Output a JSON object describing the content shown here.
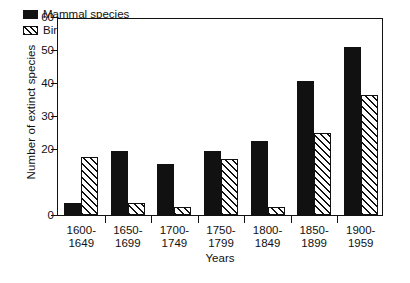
{
  "chart_data": {
    "type": "bar",
    "title": "",
    "xlabel": "Years",
    "ylabel": "Number of extinct species",
    "categories": [
      "1600-\n1649",
      "1650-\n1699",
      "1700-\n1749",
      "1750-\n1799",
      "1800-\n1849",
      "1850-\n1899",
      "1900-\n1959"
    ],
    "category_lines": [
      [
        "1600-",
        "1649"
      ],
      [
        "1650-",
        "1699"
      ],
      [
        "1700-",
        "1749"
      ],
      [
        "1750-",
        "1799"
      ],
      [
        "1800-",
        "1849"
      ],
      [
        "1850-",
        "1899"
      ],
      [
        "1900-",
        "1959"
      ]
    ],
    "series": [
      {
        "name": "Mammal species",
        "fill": "solid-black",
        "values": [
          3.5,
          19.5,
          15.5,
          19.5,
          22.5,
          40.5,
          51
        ]
      },
      {
        "name": "Birds",
        "fill": "diagonal-hatch",
        "values": [
          17.5,
          3.5,
          2.5,
          17,
          2.5,
          25,
          36.5
        ]
      }
    ],
    "ylim": [
      0,
      60
    ],
    "yticks": [
      0,
      20,
      30,
      40,
      50,
      60
    ],
    "ytick_labels": [
      "0",
      "20",
      "30",
      "40",
      "50",
      "60"
    ],
    "grid": false,
    "legend_position": "top-left-inside",
    "axis_color": "#111111",
    "background": "#ffffff"
  },
  "legend": {
    "items": [
      {
        "label": "Mammal species",
        "swatch": "solid-black"
      },
      {
        "label": "Birds",
        "swatch": "diagonal-hatch"
      }
    ]
  }
}
